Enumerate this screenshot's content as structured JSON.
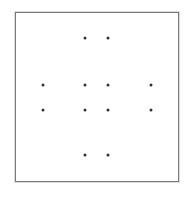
{
  "diagram": {
    "type": "dot-grid",
    "frame": {
      "left": 15,
      "top": 12,
      "right": 179,
      "bottom": 182,
      "color": "#7a7a7a"
    },
    "dot_color": "#333333",
    "dots": [
      {
        "x": 85,
        "y": 38
      },
      {
        "x": 108,
        "y": 38
      },
      {
        "x": 43,
        "y": 85
      },
      {
        "x": 85,
        "y": 85
      },
      {
        "x": 108,
        "y": 85
      },
      {
        "x": 151,
        "y": 85
      },
      {
        "x": 43,
        "y": 110
      },
      {
        "x": 85,
        "y": 110
      },
      {
        "x": 108,
        "y": 110
      },
      {
        "x": 151,
        "y": 110
      },
      {
        "x": 85,
        "y": 155
      },
      {
        "x": 108,
        "y": 155
      }
    ]
  }
}
